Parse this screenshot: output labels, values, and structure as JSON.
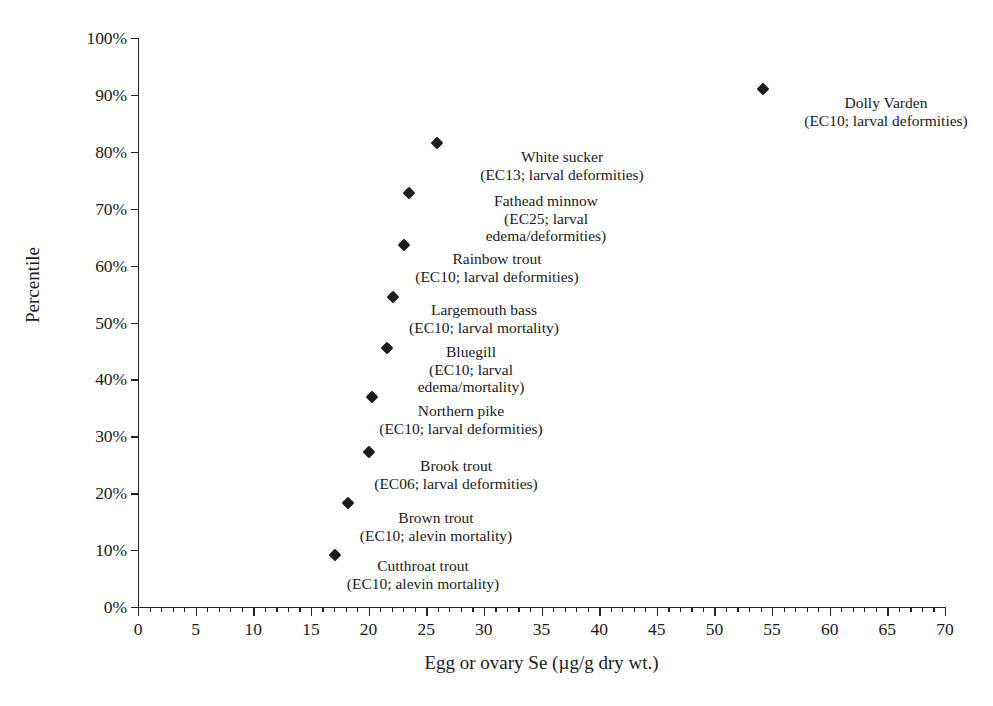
{
  "chart_data": {
    "type": "scatter",
    "title": "",
    "xlabel": "Egg or ovary Se (µg/g dry wt.)",
    "ylabel": "Percentile",
    "xlim": [
      0,
      70
    ],
    "ylim": [
      0,
      100
    ],
    "xticks": [
      0,
      5,
      10,
      15,
      20,
      25,
      30,
      35,
      40,
      45,
      50,
      55,
      60,
      65,
      70
    ],
    "xtick_labels": [
      "0",
      "5",
      "10",
      "15",
      "20",
      "25",
      "30",
      "35",
      "40",
      "45",
      "50",
      "55",
      "60",
      "65",
      "70"
    ],
    "x_minor_tick_interval": 1,
    "yticks": [
      0,
      10,
      20,
      30,
      40,
      50,
      60,
      70,
      80,
      90,
      100
    ],
    "ytick_labels": [
      "0%",
      "10%",
      "20%",
      "30%",
      "40%",
      "50%",
      "60%",
      "70%",
      "80%",
      "90%",
      "100%"
    ],
    "grid": false,
    "legend": "none",
    "marker": "diamond",
    "marker_color": "#1c1c1c",
    "points": [
      {
        "species": "Cutthroat trout",
        "detail": "(EC10; alevin mortality)",
        "label_lines": [
          "Cutthroat trout",
          "(EC10; alevin mortality)"
        ],
        "x": 17.1,
        "y": 9.1,
        "label_anchor_x": 423,
        "label_anchor_y": 557
      },
      {
        "species": "Brown trout",
        "detail": "(EC10; alevin mortality)",
        "label_lines": [
          "Brown trout",
          "(EC10; alevin mortality)"
        ],
        "x": 18.2,
        "y": 18.3,
        "label_anchor_x": 436,
        "label_anchor_y": 509
      },
      {
        "species": "Brook trout",
        "detail": "(EC06; larval deformities)",
        "label_lines": [
          "Brook trout",
          "(EC06; larval deformities)"
        ],
        "x": 20.0,
        "y": 27.2,
        "label_anchor_x": 456,
        "label_anchor_y": 457
      },
      {
        "species": "Northern pike",
        "detail": "(EC10; larval deformities)",
        "label_lines": [
          "Northern pike",
          "(EC10; larval deformities)"
        ],
        "x": 20.3,
        "y": 36.9,
        "label_anchor_x": 461,
        "label_anchor_y": 402
      },
      {
        "species": "Bluegill",
        "detail": "(EC10; larval edema/mortality)",
        "label_lines": [
          "Bluegill",
          "(EC10; larval",
          "edema/mortality)"
        ],
        "x": 21.6,
        "y": 45.5,
        "label_anchor_x": 471,
        "label_anchor_y": 343
      },
      {
        "species": "Largemouth bass",
        "detail": "(EC10; larval mortality)",
        "label_lines": [
          "Largemouth bass",
          "(EC10; larval mortality)"
        ],
        "x": 22.1,
        "y": 54.5,
        "label_anchor_x": 484,
        "label_anchor_y": 301
      },
      {
        "species": "Rainbow trout",
        "detail": "(EC10; larval deformities)",
        "label_lines": [
          "Rainbow trout",
          "(EC10; larval deformities)"
        ],
        "x": 23.1,
        "y": 63.6,
        "label_anchor_x": 497,
        "label_anchor_y": 250
      },
      {
        "species": "Fathead minnow",
        "detail": "(EC25; larval edema/deformities)",
        "label_lines": [
          "Fathead minnow",
          "(EC25; larval",
          "edema/deformities)"
        ],
        "x": 23.5,
        "y": 72.8,
        "label_anchor_x": 546,
        "label_anchor_y": 192
      },
      {
        "species": "White sucker",
        "detail": "(EC13; larval deformities)",
        "label_lines": [
          "White sucker",
          "(EC13; larval deformities)"
        ],
        "x": 25.9,
        "y": 81.5,
        "label_anchor_x": 562,
        "label_anchor_y": 148
      },
      {
        "species": "Dolly Varden",
        "detail": "(EC10; larval deformities)",
        "label_lines": [
          "Dolly Varden",
          "(EC10; larval deformities)"
        ],
        "x": 54.2,
        "y": 91.0,
        "label_anchor_x": 886,
        "label_anchor_y": 94
      }
    ]
  }
}
